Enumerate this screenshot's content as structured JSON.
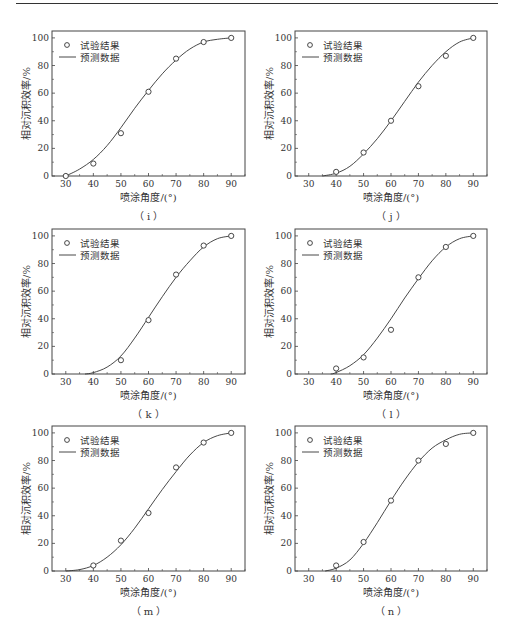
{
  "page": {
    "top_rule": true
  },
  "shared": {
    "xlabel": "喷涂角度/(°)",
    "ylabel": "相对沉积效率/%",
    "legend": {
      "points": "试验结果",
      "line": "预测数据"
    },
    "xticks": [
      30,
      40,
      50,
      60,
      70,
      80,
      90
    ],
    "yticks": [
      0,
      20,
      40,
      60,
      80,
      100
    ],
    "xlim": [
      25,
      95
    ],
    "ylim": [
      0,
      105
    ]
  },
  "chart_data": [
    {
      "id": "i",
      "caption": "（ i ）",
      "type": "scatter+line",
      "xlabel": "喷涂角度/(°)",
      "ylabel": "相对沉积效率/%",
      "legend": [
        "试验结果",
        "预测数据"
      ],
      "points": {
        "x": [
          30,
          40,
          50,
          60,
          70,
          80,
          90
        ],
        "y": [
          0,
          9,
          31,
          61,
          85,
          97,
          100
        ]
      },
      "curve": {
        "x": [
          30,
          35,
          40,
          45,
          50,
          55,
          60,
          65,
          70,
          75,
          80,
          85,
          90
        ],
        "y": [
          0,
          5,
          12,
          22,
          35,
          49,
          62,
          74,
          84,
          92,
          97,
          99,
          100
        ]
      },
      "xlim": [
        25,
        95
      ],
      "ylim": [
        0,
        105
      ]
    },
    {
      "id": "j",
      "caption": "（ j ）",
      "type": "scatter+line",
      "xlabel": "喷涂角度/(°)",
      "ylabel": "相对沉积效率/%",
      "legend": [
        "试验结果",
        "预测数据"
      ],
      "points": {
        "x": [
          40,
          50,
          60,
          70,
          80,
          90
        ],
        "y": [
          3,
          17,
          40,
          65,
          87,
          100
        ]
      },
      "curve": {
        "x": [
          35,
          40,
          45,
          50,
          55,
          60,
          65,
          70,
          75,
          80,
          85,
          90
        ],
        "y": [
          0,
          2,
          7,
          16,
          27,
          40,
          54,
          68,
          80,
          90,
          97,
          100
        ]
      },
      "xlim": [
        25,
        95
      ],
      "ylim": [
        0,
        105
      ]
    },
    {
      "id": "k",
      "caption": "（ k ）",
      "type": "scatter+line",
      "xlabel": "喷涂角度/(°)",
      "ylabel": "相对沉积效率/%",
      "legend": [
        "试验结果",
        "预测数据"
      ],
      "points": {
        "x": [
          50,
          60,
          70,
          80,
          90
        ],
        "y": [
          10,
          39,
          72,
          93,
          100
        ]
      },
      "curve": {
        "x": [
          37,
          40,
          45,
          50,
          55,
          60,
          65,
          70,
          75,
          80,
          85,
          90
        ],
        "y": [
          0,
          1,
          5,
          13,
          26,
          41,
          56,
          70,
          82,
          92,
          98,
          100
        ]
      },
      "xlim": [
        25,
        95
      ],
      "ylim": [
        0,
        105
      ]
    },
    {
      "id": "l",
      "caption": "（ l ）",
      "type": "scatter+line",
      "xlabel": "喷涂角度/(°)",
      "ylabel": "相对沉积效率/%",
      "legend": [
        "试验结果",
        "预测数据"
      ],
      "points": {
        "x": [
          40,
          50,
          60,
          70,
          80,
          90
        ],
        "y": [
          4,
          12,
          32,
          70,
          92,
          100
        ]
      },
      "curve": {
        "x": [
          38,
          40,
          45,
          50,
          55,
          60,
          65,
          70,
          75,
          80,
          85,
          90
        ],
        "y": [
          0,
          1,
          6,
          14,
          26,
          40,
          55,
          69,
          82,
          92,
          98,
          100
        ]
      },
      "xlim": [
        25,
        95
      ],
      "ylim": [
        0,
        105
      ]
    },
    {
      "id": "m",
      "caption": "（ m ）",
      "type": "scatter+line",
      "xlabel": "喷涂角度/(°)",
      "ylabel": "相对沉积效率/%",
      "legend": [
        "试验结果",
        "预测数据"
      ],
      "points": {
        "x": [
          40,
          50,
          60,
          70,
          80,
          90
        ],
        "y": [
          4,
          22,
          42,
          75,
          93,
          100
        ]
      },
      "curve": {
        "x": [
          30,
          35,
          40,
          45,
          50,
          55,
          60,
          65,
          70,
          75,
          80,
          85,
          90
        ],
        "y": [
          0,
          1,
          4,
          10,
          19,
          31,
          45,
          59,
          72,
          84,
          93,
          98,
          100
        ]
      },
      "xlim": [
        25,
        95
      ],
      "ylim": [
        0,
        105
      ]
    },
    {
      "id": "n",
      "caption": "（ n ）",
      "type": "scatter+line",
      "xlabel": "喷涂角度/(°)",
      "ylabel": "相对沉积效率/%",
      "legend": [
        "试验结果",
        "预测数据"
      ],
      "points": {
        "x": [
          40,
          50,
          60,
          70,
          80,
          90
        ],
        "y": [
          4,
          21,
          51,
          80,
          92,
          100
        ]
      },
      "curve": {
        "x": [
          36,
          40,
          45,
          50,
          55,
          60,
          65,
          70,
          75,
          80,
          85,
          90
        ],
        "y": [
          0,
          2,
          8,
          20,
          35,
          51,
          66,
          79,
          89,
          95,
          99,
          100
        ]
      },
      "xlim": [
        25,
        95
      ],
      "ylim": [
        0,
        105
      ]
    }
  ]
}
